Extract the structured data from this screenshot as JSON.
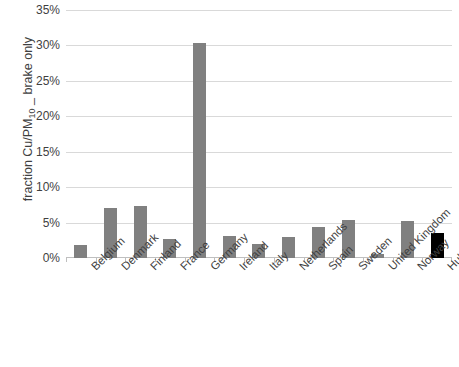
{
  "chart_data": {
    "type": "bar",
    "title": "",
    "xlabel": "",
    "ylabel": "fraction Cu/PM10 _ brake only",
    "ylabel_parts": {
      "prefix": "fraction Cu/PM",
      "subscript": "10",
      "suffix": " _ brake only"
    },
    "ylim": [
      0,
      35
    ],
    "ytick_labels": [
      "35%",
      "30%",
      "25%",
      "20%",
      "15%",
      "10%",
      "5%",
      "0%"
    ],
    "ytick_values": [
      35,
      30,
      25,
      20,
      15,
      10,
      5,
      0
    ],
    "grid": true,
    "legend": "none",
    "value_unit": "%",
    "categories": [
      "Belgium",
      "Denmark",
      "Finland",
      "France",
      "Germany",
      "Ireland",
      "Italy",
      "Netherlands",
      "Spain",
      "Sweden",
      "United Kingdom",
      "Norway",
      "Hulskotte et al. (2014)"
    ],
    "values": [
      1.8,
      7.0,
      7.3,
      2.7,
      30.3,
      3.1,
      2.0,
      2.9,
      4.4,
      5.3,
      0.5,
      5.2,
      3.6
    ],
    "bar_colors": [
      "#808080",
      "#808080",
      "#808080",
      "#808080",
      "#808080",
      "#808080",
      "#808080",
      "#808080",
      "#808080",
      "#808080",
      "#808080",
      "#808080",
      "#000000"
    ],
    "series": [
      {
        "name": "fraction Cu/PM10 - brake only",
        "values": [
          1.8,
          7.0,
          7.3,
          2.7,
          30.3,
          3.1,
          2.0,
          2.9,
          4.4,
          5.3,
          0.5,
          5.2,
          3.6
        ]
      }
    ],
    "colors": {
      "bar_default": "#808080",
      "bar_highlight": "#000000",
      "gridline": "#d9d9d9",
      "axis": "#bfbfbf",
      "text": "#3f3f3f",
      "background": "#ffffff"
    }
  }
}
